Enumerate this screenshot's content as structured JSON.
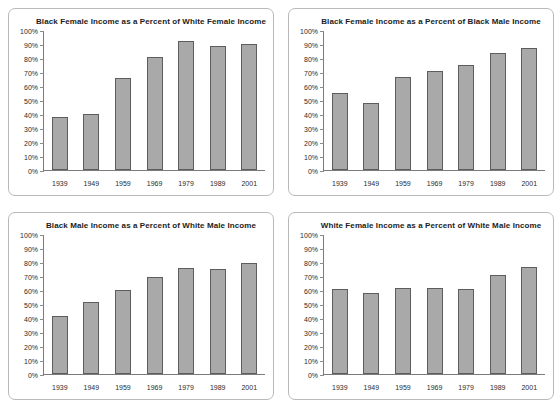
{
  "figure": {
    "panel_count": 4,
    "background_color": "#ffffff",
    "bar_fill_color": "#a9a9a9",
    "bar_border_color": "#5d5d5d",
    "axis_color": "#7a7a7a",
    "panel_border_color": "#b9b9b9"
  },
  "chart_data": [
    {
      "type": "bar",
      "title": "Black Female Income as a Percent of White Female Income",
      "categories": [
        "1939",
        "1949",
        "1959",
        "1969",
        "1979",
        "1989",
        "2001"
      ],
      "values": [
        38,
        40.5,
        66,
        81,
        93,
        89.5,
        90.5
      ],
      "xlabel": "",
      "ylabel": "",
      "ylim": [
        0,
        100
      ],
      "yticks": [
        0,
        10,
        20,
        30,
        40,
        50,
        60,
        70,
        80,
        90,
        100
      ],
      "ytick_labels": [
        "0%",
        "10%",
        "20%",
        "30%",
        "40%",
        "50%",
        "60%",
        "70%",
        "80%",
        "90%",
        "100%"
      ],
      "grid": false,
      "legend": false
    },
    {
      "type": "bar",
      "title": "Black Female Income as a Percent of Black Male Income",
      "categories": [
        "1939",
        "1949",
        "1959",
        "1969",
        "1979",
        "1989",
        "2001"
      ],
      "values": [
        55.5,
        48.5,
        67,
        71,
        75.5,
        84.5,
        87.5
      ],
      "xlabel": "",
      "ylabel": "",
      "ylim": [
        0,
        100
      ],
      "yticks": [
        0,
        10,
        20,
        30,
        40,
        50,
        60,
        70,
        80,
        90,
        100
      ],
      "ytick_labels": [
        "0%",
        "10%",
        "20%",
        "30%",
        "40%",
        "50%",
        "60%",
        "70%",
        "80%",
        "90%",
        "100%"
      ],
      "grid": false,
      "legend": false
    },
    {
      "type": "bar",
      "title": "Black Male Income as a Percent of White Male Income",
      "categories": [
        "1939",
        "1949",
        "1959",
        "1969",
        "1979",
        "1989",
        "2001"
      ],
      "values": [
        41.5,
        51.5,
        60.5,
        70,
        76,
        75.5,
        80
      ],
      "xlabel": "",
      "ylabel": "",
      "ylim": [
        0,
        100
      ],
      "yticks": [
        0,
        10,
        20,
        30,
        40,
        50,
        60,
        70,
        80,
        90,
        100
      ],
      "ytick_labels": [
        "0%",
        "10%",
        "20%",
        "30%",
        "40%",
        "50%",
        "60%",
        "70%",
        "80%",
        "90%",
        "100%"
      ],
      "grid": false,
      "legend": false
    },
    {
      "type": "bar",
      "title": "White Female Income as a Percent of White Male Income",
      "categories": [
        "1939",
        "1949",
        "1959",
        "1969",
        "1979",
        "1989",
        "2001"
      ],
      "values": [
        61.5,
        58.5,
        62,
        62,
        61.5,
        71,
        77
      ],
      "xlabel": "",
      "ylabel": "",
      "ylim": [
        0,
        100
      ],
      "yticks": [
        0,
        10,
        20,
        30,
        40,
        50,
        60,
        70,
        80,
        90,
        100
      ],
      "ytick_labels": [
        "0%",
        "10%",
        "20%",
        "30%",
        "40%",
        "50%",
        "60%",
        "70%",
        "80%",
        "90%",
        "100%"
      ],
      "grid": false,
      "legend": false
    }
  ]
}
